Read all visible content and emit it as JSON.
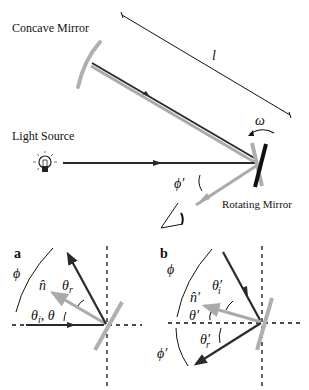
{
  "diagram": {
    "colors": {
      "dark_ray": "#2a2a2a",
      "light_ray": "#aaaaaa",
      "mirror": "#b0b0b0",
      "rotating_mirror_dark": "#111111",
      "text": "#111111"
    },
    "labels": {
      "concave_mirror": "Concave Mirror",
      "light_source": "Light Source",
      "rotating_mirror": "Rotating Mirror",
      "distance": "l",
      "angular_velocity": "ω",
      "phi_prime_main": "ϕ′"
    },
    "icons": {
      "light_source": "lightbulb-icon",
      "observer": "eye-angle-icon"
    },
    "panel_a": {
      "label": "a",
      "phi": "ϕ",
      "normal": "n̂",
      "theta_r": "θr",
      "theta_i_theta": "θi, θ"
    },
    "panel_b": {
      "label": "b",
      "phi": "ϕ",
      "normal": "n̂′",
      "theta_i": "θ′i",
      "theta": "θ′",
      "theta_r": "θ′r",
      "phi_prime": "ϕ′"
    }
  }
}
